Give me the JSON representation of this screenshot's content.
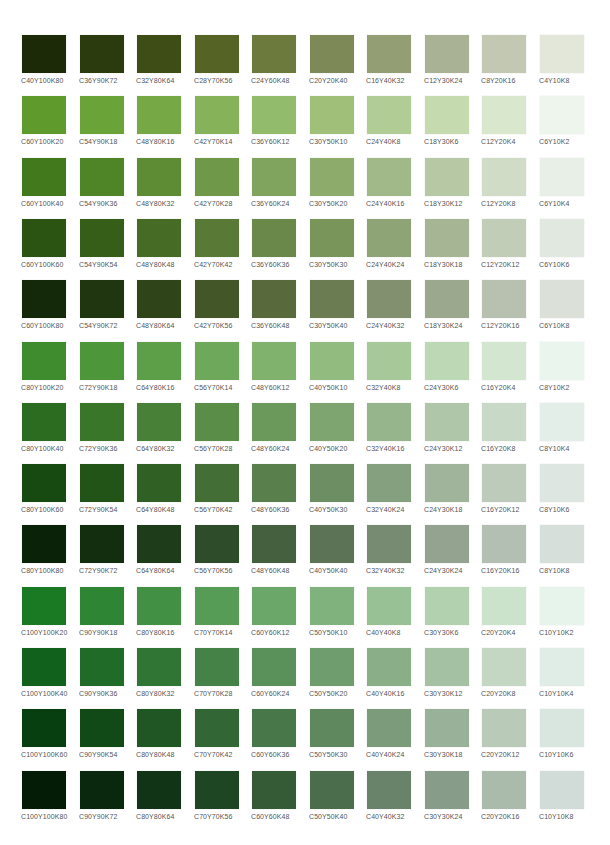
{
  "rows": [
    {
      "swatches": [
        {
          "label": "C40Y100K80",
          "color": "#1c2a08"
        },
        {
          "label": "C36Y90K72",
          "color": "#2b3b0e"
        },
        {
          "label": "C32Y80K64",
          "color": "#3e4d16"
        },
        {
          "label": "C28Y70K56",
          "color": "#556425"
        },
        {
          "label": "C24Y60K48",
          "color": "#6c7a3e"
        },
        {
          "label": "C20Y20K40",
          "color": "#7d8a57"
        },
        {
          "label": "C16Y40K32",
          "color": "#949e74"
        },
        {
          "label": "C12Y30K24",
          "color": "#aab295"
        },
        {
          "label": "C8Y20K16",
          "color": "#c3c8b3"
        },
        {
          "label": "C4Y10K8",
          "color": "#e3e7da"
        }
      ]
    },
    {
      "swatches": [
        {
          "label": "C60Y100K20",
          "color": "#5e9a2c"
        },
        {
          "label": "C54Y90K18",
          "color": "#6aa337"
        },
        {
          "label": "C48Y80K16",
          "color": "#76a845"
        },
        {
          "label": "C42Y70K14",
          "color": "#86b35a"
        },
        {
          "label": "C36Y60K12",
          "color": "#93bb6c"
        },
        {
          "label": "C30Y50K10",
          "color": "#a0c07a"
        },
        {
          "label": "C24Y40K8",
          "color": "#b2cc96"
        },
        {
          "label": "C18Y30K6",
          "color": "#c6dab0"
        },
        {
          "label": "C12Y20K4",
          "color": "#d9e7cd"
        },
        {
          "label": "C6Y10K2",
          "color": "#eef5ec"
        }
      ]
    },
    {
      "swatches": [
        {
          "label": "C60Y100K40",
          "color": "#43791d"
        },
        {
          "label": "C54Y90K36",
          "color": "#4f8427"
        },
        {
          "label": "C48Y80K32",
          "color": "#5e8c35"
        },
        {
          "label": "C42Y70K28",
          "color": "#6f9848"
        },
        {
          "label": "C36Y60K24",
          "color": "#80a35d"
        },
        {
          "label": "C30Y50K20",
          "color": "#8dab6a"
        },
        {
          "label": "C24Y40K16",
          "color": "#a1b988"
        },
        {
          "label": "C18Y30K12",
          "color": "#b7c8a4"
        },
        {
          "label": "C12Y20K8",
          "color": "#d0dcc5"
        },
        {
          "label": "C6Y10K4",
          "color": "#e8efe7"
        }
      ]
    },
    {
      "swatches": [
        {
          "label": "C60Y100K60",
          "color": "#2b5412"
        },
        {
          "label": "C54Y90K54",
          "color": "#365e19"
        },
        {
          "label": "C48Y80K48",
          "color": "#466b25"
        },
        {
          "label": "C42Y70K42",
          "color": "#587a36"
        },
        {
          "label": "C36Y60K36",
          "color": "#6a8849"
        },
        {
          "label": "C30Y50K30",
          "color": "#7a955a"
        },
        {
          "label": "C24Y40K24",
          "color": "#8ea477"
        },
        {
          "label": "C18Y30K18",
          "color": "#a6b695"
        },
        {
          "label": "C12Y20K12",
          "color": "#c2cdb8"
        },
        {
          "label": "C6Y10K6",
          "color": "#e1e8df"
        }
      ]
    },
    {
      "swatches": [
        {
          "label": "C60Y100K80",
          "color": "#14290a"
        },
        {
          "label": "C54Y90K72",
          "color": "#1f3610"
        },
        {
          "label": "C48Y80K64",
          "color": "#2f4419"
        },
        {
          "label": "C42Y70K56",
          "color": "#435628"
        },
        {
          "label": "C36Y60K48",
          "color": "#58693b"
        },
        {
          "label": "C30Y50K40",
          "color": "#6c7c52"
        },
        {
          "label": "C24Y40K32",
          "color": "#839070"
        },
        {
          "label": "C18Y30K24",
          "color": "#9ca88e"
        },
        {
          "label": "C12Y20K16",
          "color": "#b8c1b0"
        },
        {
          "label": "C6Y10K8",
          "color": "#dbe1d8"
        }
      ]
    },
    {
      "swatches": [
        {
          "label": "C80Y100K20",
          "color": "#3f8c2e"
        },
        {
          "label": "C72Y90K18",
          "color": "#4e963a"
        },
        {
          "label": "C64Y80K16",
          "color": "#5d9f48"
        },
        {
          "label": "C56Y70K14",
          "color": "#6ea85a"
        },
        {
          "label": "C48Y60K12",
          "color": "#80b26d"
        },
        {
          "label": "C40Y50K10",
          "color": "#92bb80"
        },
        {
          "label": "C32Y40K8",
          "color": "#a7c999"
        },
        {
          "label": "C24Y30K6",
          "color": "#bdd8b4"
        },
        {
          "label": "C16Y20K4",
          "color": "#d3e6d0"
        },
        {
          "label": "C8Y10K2",
          "color": "#eaf5ee"
        }
      ]
    },
    {
      "swatches": [
        {
          "label": "C80Y100K40",
          "color": "#2c6c20"
        },
        {
          "label": "C72Y90K36",
          "color": "#397629"
        },
        {
          "label": "C64Y80K32",
          "color": "#478036"
        },
        {
          "label": "C56Y70K28",
          "color": "#598d48"
        },
        {
          "label": "C48Y60K24",
          "color": "#6b995c"
        },
        {
          "label": "C40Y50K20",
          "color": "#7ea470"
        },
        {
          "label": "C32Y40K16",
          "color": "#96b58d"
        },
        {
          "label": "C24Y30K12",
          "color": "#afc6a9"
        },
        {
          "label": "C16Y20K8",
          "color": "#c9d9c7"
        },
        {
          "label": "C8Y10K4",
          "color": "#e3eee8"
        }
      ]
    },
    {
      "swatches": [
        {
          "label": "C80Y100K60",
          "color": "#164a11"
        },
        {
          "label": "C72Y90K54",
          "color": "#225418"
        },
        {
          "label": "C64Y80K48",
          "color": "#316025"
        },
        {
          "label": "C56Y70K42",
          "color": "#436f37"
        },
        {
          "label": "C48Y60K36",
          "color": "#587f4c"
        },
        {
          "label": "C40Y50K30",
          "color": "#6c8e62"
        },
        {
          "label": "C32Y40K24",
          "color": "#85a07f"
        },
        {
          "label": "C24Y30K18",
          "color": "#a0b49b"
        },
        {
          "label": "C16Y20K12",
          "color": "#bdcbbb"
        },
        {
          "label": "C8Y10K6",
          "color": "#dde6e0"
        }
      ]
    },
    {
      "swatches": [
        {
          "label": "C80Y100K80",
          "color": "#0a2208"
        },
        {
          "label": "C72Y90K72",
          "color": "#122e0f"
        },
        {
          "label": "C64Y80K64",
          "color": "#1e3b1a"
        },
        {
          "label": "C56Y70K56",
          "color": "#2f4c2a"
        },
        {
          "label": "C48Y60K48",
          "color": "#45603f"
        },
        {
          "label": "C40Y50K40",
          "color": "#5c7356"
        },
        {
          "label": "C32Y40K32",
          "color": "#778a72"
        },
        {
          "label": "C24Y30K24",
          "color": "#94a290"
        },
        {
          "label": "C16Y20K16",
          "color": "#b3bfb2"
        },
        {
          "label": "C8Y10K8",
          "color": "#d7dfda"
        }
      ]
    },
    {
      "swatches": [
        {
          "label": "C100Y100K20",
          "color": "#1a7a24"
        },
        {
          "label": "C90Y90K18",
          "color": "#2e8534"
        },
        {
          "label": "C80Y80K16",
          "color": "#429044"
        },
        {
          "label": "C70Y70K14",
          "color": "#569b56"
        },
        {
          "label": "C60Y60K12",
          "color": "#6aa769"
        },
        {
          "label": "C50Y50K10",
          "color": "#80b27d"
        },
        {
          "label": "C40Y40K8",
          "color": "#98c296"
        },
        {
          "label": "C30Y30K6",
          "color": "#b1d1af"
        },
        {
          "label": "C20Y20K4",
          "color": "#cce3cb"
        },
        {
          "label": "C10Y10K2",
          "color": "#e6f4ec"
        }
      ]
    },
    {
      "swatches": [
        {
          "label": "C100Y100K40",
          "color": "#11601b"
        },
        {
          "label": "C90Y90K36",
          "color": "#1f6b27"
        },
        {
          "label": "C80Y80K32",
          "color": "#317535"
        },
        {
          "label": "C70Y70K28",
          "color": "#458247"
        },
        {
          "label": "C60Y60K24",
          "color": "#5a905a"
        },
        {
          "label": "C50Y50K20",
          "color": "#6f9d6e"
        },
        {
          "label": "C40Y40K16",
          "color": "#89ae88"
        },
        {
          "label": "C30Y30K12",
          "color": "#a5c1a4"
        },
        {
          "label": "C20Y20K8",
          "color": "#c3d7c3"
        },
        {
          "label": "C10Y10K4",
          "color": "#e0ede7"
        }
      ]
    },
    {
      "swatches": [
        {
          "label": "C100Y100K60",
          "color": "#083f10"
        },
        {
          "label": "C90Y90K54",
          "color": "#114a17"
        },
        {
          "label": "C80Y80K48",
          "color": "#1f5623"
        },
        {
          "label": "C70Y70K42",
          "color": "#326634"
        },
        {
          "label": "C60Y60K36",
          "color": "#487749"
        },
        {
          "label": "C50Y50K30",
          "color": "#5f885f"
        },
        {
          "label": "C40Y40K24",
          "color": "#7b9b7a"
        },
        {
          "label": "C30Y30K18",
          "color": "#99b198"
        },
        {
          "label": "C20Y20K12",
          "color": "#b9cab9"
        },
        {
          "label": "C10Y10K6",
          "color": "#d9e6e0"
        }
      ]
    },
    {
      "swatches": [
        {
          "label": "C100Y100K80",
          "color": "#041c06"
        },
        {
          "label": "C90Y90K72",
          "color": "#0a280d"
        },
        {
          "label": "C80Y80K64",
          "color": "#123416"
        },
        {
          "label": "C70Y70K56",
          "color": "#1f4622"
        },
        {
          "label": "C60Y60K48",
          "color": "#345a36"
        },
        {
          "label": "C50Y50K40",
          "color": "#4c6d4c"
        },
        {
          "label": "C40Y40K32",
          "color": "#69836a"
        },
        {
          "label": "C30Y30K24",
          "color": "#889d89"
        },
        {
          "label": "C20Y20K16",
          "color": "#aabaab"
        },
        {
          "label": "C10Y10K8",
          "color": "#d1dcd8"
        }
      ]
    }
  ]
}
